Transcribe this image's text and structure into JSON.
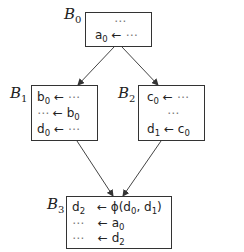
{
  "diagram": {
    "type": "control-flow-graph",
    "blocks": [
      {
        "id": "B0",
        "label": "B",
        "sub": "0",
        "lines": [
          {
            "text": "⋯"
          },
          {
            "lhs": "a",
            "lhs_sub": "0",
            "arrow": "←",
            "rhs": "⋯"
          }
        ]
      },
      {
        "id": "B1",
        "label": "B",
        "sub": "1",
        "lines": [
          {
            "lhs": "b",
            "lhs_sub": "0",
            "arrow": "←",
            "rhs": "⋯"
          },
          {
            "lhs": "⋯",
            "arrow": "←",
            "rhs": "b",
            "rhs_sub": "0"
          },
          {
            "lhs": "d",
            "lhs_sub": "0",
            "arrow": "←",
            "rhs": "⋯"
          }
        ]
      },
      {
        "id": "B2",
        "label": "B",
        "sub": "2",
        "lines": [
          {
            "lhs": "c",
            "lhs_sub": "0",
            "arrow": "←",
            "rhs": "⋯"
          },
          {
            "text": "⋯"
          },
          {
            "lhs": "d",
            "lhs_sub": "1",
            "arrow": "←",
            "rhs": "c",
            "rhs_sub": "0"
          }
        ]
      },
      {
        "id": "B3",
        "label": "B",
        "sub": "3",
        "lines": [
          {
            "lhs": "d",
            "lhs_sub": "2",
            "arrow": "←",
            "rhs": "ϕ(d",
            "rhs_sub": "0",
            "rhs_tail": ", d",
            "rhs_sub2": "1",
            "rhs_end": ")"
          },
          {
            "lhs": "⋯",
            "arrow": "←",
            "rhs": "a",
            "rhs_sub": "0"
          },
          {
            "lhs": "⋯",
            "arrow": "←",
            "rhs": "d",
            "rhs_sub": "2"
          }
        ]
      }
    ],
    "edges": [
      {
        "from": "B0",
        "to": "B1"
      },
      {
        "from": "B0",
        "to": "B2"
      },
      {
        "from": "B1",
        "to": "B3"
      },
      {
        "from": "B2",
        "to": "B3"
      }
    ]
  }
}
